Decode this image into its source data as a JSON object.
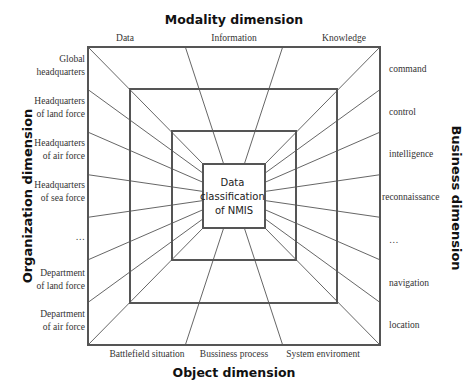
{
  "title_top": "Modality dimension",
  "title_bottom": "Object dimension",
  "title_left": "Organization dimension",
  "title_right": "Business dimension",
  "center_label": [
    "Data",
    "classification",
    "of NMIS"
  ],
  "modality": [
    "Data",
    "Information",
    "Knowledge"
  ],
  "object": [
    "Battlefield situation",
    "Bussiness process",
    "System enviroment"
  ],
  "organization": [
    [
      "Global",
      "headquarters"
    ],
    [
      "Headquarters",
      "of land force"
    ],
    [
      "Headquarters",
      "of air force"
    ],
    [
      "Headquarters",
      "of  sea force"
    ],
    [
      "…"
    ],
    [
      "Department",
      "of land force"
    ],
    [
      "Department",
      "of air force"
    ]
  ],
  "business": [
    "command",
    "control",
    "intelligence",
    "reconnaissance",
    "…",
    "navigation",
    "location"
  ],
  "colors": {
    "line": "#555555",
    "square": "#555555",
    "text": "#333333"
  },
  "squares": [
    {
      "name": "outer-square",
      "x1": 88,
      "y1": 47,
      "x2": 380,
      "y2": 345
    },
    {
      "name": "middle-square",
      "x1": 130,
      "y1": 89,
      "x2": 337,
      "y2": 303
    },
    {
      "name": "third-square",
      "x1": 172,
      "y1": 131,
      "x2": 296,
      "y2": 260
    },
    {
      "name": "center-square",
      "x1": 203,
      "y1": 164,
      "x2": 265,
      "y2": 228
    }
  ]
}
